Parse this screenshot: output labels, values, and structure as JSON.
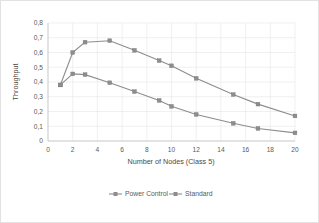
{
  "chart_data": {
    "type": "line",
    "title": "",
    "xlabel": "Number of Nodes (Class 5)",
    "ylabel": "Throughput",
    "x": [
      1,
      2,
      3,
      5,
      7,
      9,
      10,
      12,
      15,
      17,
      20
    ],
    "xlim": [
      0,
      20
    ],
    "ylim": [
      0,
      0.8
    ],
    "grid": true,
    "legend_position": "bottom",
    "xticks": [
      "0",
      "2",
      "4",
      "6",
      "8",
      "10",
      "12",
      "14",
      "16",
      "18",
      "20"
    ],
    "xtick_values": [
      0,
      2,
      4,
      6,
      8,
      10,
      12,
      14,
      16,
      18,
      20
    ],
    "yticks": [
      "0",
      "0,1",
      "0,2",
      "0,3",
      "0,4",
      "0,5",
      "0,6",
      "0,7",
      "0,8"
    ],
    "ytick_values": [
      0,
      0.1,
      0.2,
      0.3,
      0.4,
      0.5,
      0.6,
      0.7,
      0.8
    ],
    "series": [
      {
        "name": "Power Control",
        "color": "#8d8d8d",
        "marker": "square",
        "values": [
          0.38,
          0.6,
          0.67,
          0.68,
          0.615,
          0.545,
          0.51,
          0.425,
          0.315,
          0.25,
          0.17
        ]
      },
      {
        "name": "Standard",
        "color": "#8d8d8d",
        "marker": "square",
        "values": [
          0.38,
          0.455,
          0.45,
          0.395,
          0.335,
          0.275,
          0.235,
          0.18,
          0.12,
          0.085,
          0.055
        ]
      }
    ]
  },
  "legend": {
    "items": [
      {
        "label": "Power Control"
      },
      {
        "label": "Standard"
      }
    ]
  },
  "axes": {
    "x_title": "Number of Nodes (Class 5)",
    "y_title": "Throughput"
  }
}
